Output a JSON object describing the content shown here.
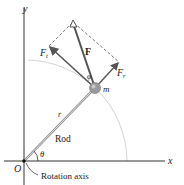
{
  "labels": {
    "y_axis": "y",
    "x_axis": "x",
    "origin": "O",
    "rod": "Rod",
    "radius": "r",
    "theta": "θ",
    "phi": "φ",
    "mass": "m",
    "force": "F",
    "tangential_force": "F",
    "tangential_sub": "t",
    "radial_force": "F",
    "radial_sub": "r",
    "rotation_axis": "Rotation axis"
  },
  "colors": {
    "axis": "#333333",
    "force": "#555555",
    "arc": "#cccccc",
    "mass": "#9a9a9a"
  }
}
